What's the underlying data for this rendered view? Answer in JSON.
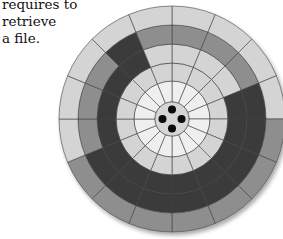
{
  "caption": {
    "line1": "requires to retrieve",
    "line2": "a file."
  },
  "diagram": {
    "type": "disk-platter",
    "center": [
      172,
      119
    ],
    "hub": {
      "radius": 17,
      "color": "#d6d6d6",
      "spindle_holes": 4
    },
    "colors": {
      "W": "#efefef",
      "L": "#d4d4d4",
      "M": "#8e8e8e",
      "D": "#3a3a3a",
      "line": "#444444"
    },
    "rings": [
      {
        "r_inner": 17,
        "r_outer": 38,
        "sectors": "WWWWWWWWWWWWWWWW"
      },
      {
        "r_inner": 38,
        "r_outer": 56,
        "sectors": "LLLLLLLLLLLLLLLL"
      },
      {
        "r_inner": 56,
        "r_outer": 75,
        "sectors": "LLLDDDDDDDDDDDDL"
      },
      {
        "r_inner": 75,
        "r_outer": 94,
        "sectors": "MMMDDDDDDDDMMMDM"
      },
      {
        "r_inner": 94,
        "r_outer": 113,
        "sectors": "LLLLMMMMMMMLLLLL"
      }
    ]
  }
}
